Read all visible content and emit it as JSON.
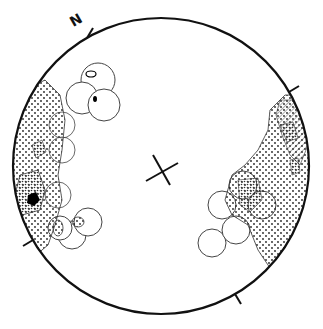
{
  "diagram": {
    "type": "stereonet",
    "north_label": "N",
    "primitive": {
      "cx": 161,
      "cy": 166,
      "r": 148
    },
    "colors": {
      "outline": "#111111",
      "fill": "#ffffff",
      "thin_line": "#444444",
      "solid": "#000000"
    },
    "ticks": [
      {
        "name": "north",
        "angle": -120
      },
      {
        "name": "east",
        "angle": -30
      },
      {
        "name": "south",
        "angle": 60
      },
      {
        "name": "west",
        "angle": 150
      }
    ],
    "center_cross": {
      "x": 158,
      "y": 172
    },
    "legend_patterns": [
      "open-circle-envelope",
      "dotted-stipple",
      "dense-stipple",
      "hatched",
      "solid-black"
    ]
  }
}
